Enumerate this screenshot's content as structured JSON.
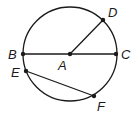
{
  "diagram": {
    "type": "circle-geometry",
    "circle": {
      "cx": 70,
      "cy": 54,
      "r": 47,
      "stroke": "#1a1a1a"
    },
    "points": [
      {
        "id": "A",
        "label": "A",
        "x": 70,
        "y": 54,
        "lx": 58,
        "ly": 70
      },
      {
        "id": "B",
        "label": "B",
        "x": 23,
        "y": 54,
        "lx": 8,
        "ly": 59
      },
      {
        "id": "C",
        "label": "C",
        "x": 116,
        "y": 54,
        "lx": 121,
        "ly": 59
      },
      {
        "id": "D",
        "label": "D",
        "x": 103,
        "y": 20,
        "lx": 108,
        "ly": 17
      },
      {
        "id": "E",
        "label": "E",
        "x": 26,
        "y": 71,
        "lx": 11,
        "ly": 77
      },
      {
        "id": "F",
        "label": "F",
        "x": 94,
        "y": 96,
        "lx": 97,
        "ly": 111
      }
    ],
    "segments": [
      {
        "from": "B",
        "to": "C",
        "name": "diameter-BC"
      },
      {
        "from": "A",
        "to": "D",
        "name": "radius-AD"
      },
      {
        "from": "E",
        "to": "F",
        "name": "chord-EF"
      }
    ]
  }
}
